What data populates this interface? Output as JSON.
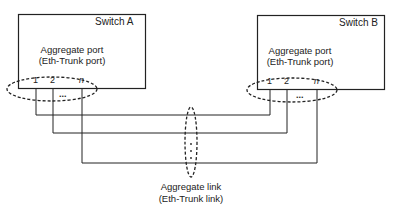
{
  "switches": [
    {
      "name": "Switch A",
      "port_label_1": "Aggregate port",
      "port_label_2": "(Eth-Trunk port)",
      "ports": [
        "1",
        "2",
        "n"
      ],
      "ellipsis": "..."
    },
    {
      "name": "Switch B",
      "port_label_1": "Aggregate port",
      "port_label_2": "(Eth-Trunk port)",
      "ports": [
        "1",
        "2",
        "n"
      ],
      "ellipsis": "..."
    }
  ],
  "link": {
    "label_1": "Aggregate link",
    "label_2": "(Eth-Trunk link)"
  },
  "colors": {
    "line": "#222222",
    "background": "#ffffff"
  }
}
